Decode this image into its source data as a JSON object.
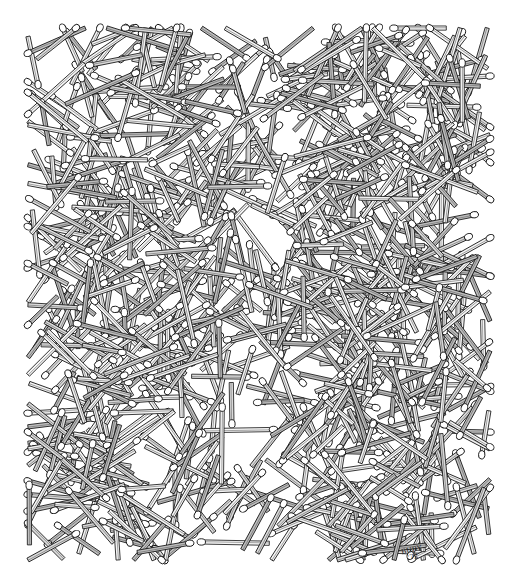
{
  "artwork": {
    "subject": "pile of scattered matchsticks",
    "style": "black ink line drawing on white",
    "background_color": "#ffffff",
    "ink_color": "#111111",
    "stick_fill": "#f4f4f4",
    "head_fill": "#ffffff",
    "bounds": {
      "x0": 28,
      "y0": 28,
      "x1": 490,
      "y1": 560
    },
    "match_count": 900,
    "match_length_range": [
      40,
      78
    ],
    "match_width": 4.2,
    "head_rx": 4.2,
    "head_ry": 3.2,
    "seed": 1972,
    "dense_clusters": [
      {
        "cx": 150,
        "cy": 110,
        "r": 110
      },
      {
        "cx": 390,
        "cy": 110,
        "r": 100
      },
      {
        "cx": 270,
        "cy": 260,
        "r": 110
      },
      {
        "cx": 110,
        "cy": 290,
        "r": 90
      },
      {
        "cx": 400,
        "cy": 320,
        "r": 90
      },
      {
        "cx": 130,
        "cy": 460,
        "r": 100
      },
      {
        "cx": 400,
        "cy": 470,
        "r": 90
      }
    ]
  },
  "signature": {
    "line1": "BURY",
    "line2": "'72"
  }
}
